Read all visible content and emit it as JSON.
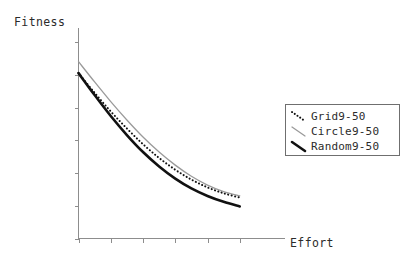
{
  "chart_data": {
    "type": "line",
    "title": "",
    "xlabel": "Effort",
    "ylabel": "Fitness",
    "grid": false,
    "legend_position": "right",
    "xlim": [
      0,
      6
    ],
    "ylim": [
      0,
      6
    ],
    "x_ticks": [
      0,
      1,
      2,
      3,
      4,
      5
    ],
    "y_ticks": [
      0,
      1,
      2,
      3,
      4,
      5,
      6
    ],
    "x_tick_labels": [
      "",
      "",
      "",
      "",
      "",
      ""
    ],
    "y_tick_labels": [
      "",
      "",
      "",
      "",
      "",
      "",
      ""
    ],
    "x": [
      0,
      0.5,
      1,
      1.5,
      2,
      2.5,
      3,
      3.5,
      4,
      4.5,
      5
    ],
    "series": [
      {
        "name": "Grid9-50",
        "style": "dotted",
        "color": "#111111",
        "width": 2.0,
        "values": [
          5.05,
          4.45,
          3.88,
          3.36,
          2.88,
          2.46,
          2.1,
          1.8,
          1.56,
          1.38,
          1.25
        ]
      },
      {
        "name": "Circle9-50",
        "style": "solid",
        "color": "#9a9a9a",
        "width": 1.3,
        "values": [
          5.4,
          4.78,
          4.18,
          3.62,
          3.1,
          2.64,
          2.24,
          1.9,
          1.63,
          1.43,
          1.3
        ]
      },
      {
        "name": "Random9-50",
        "style": "solid",
        "color": "#111111",
        "width": 2.6,
        "values": [
          5.05,
          4.38,
          3.74,
          3.16,
          2.64,
          2.2,
          1.83,
          1.53,
          1.3,
          1.12,
          0.98
        ]
      }
    ]
  },
  "axes": {
    "y_label": "Fitness",
    "x_label": "Effort",
    "axis_color": "#8d8d8d"
  },
  "legend": {
    "items": [
      {
        "label": "Grid9-50",
        "sample": "dotted-black-line"
      },
      {
        "label": "Circle9-50",
        "sample": "solid-gray-line"
      },
      {
        "label": "Random9-50",
        "sample": "thick-black-line"
      }
    ]
  }
}
